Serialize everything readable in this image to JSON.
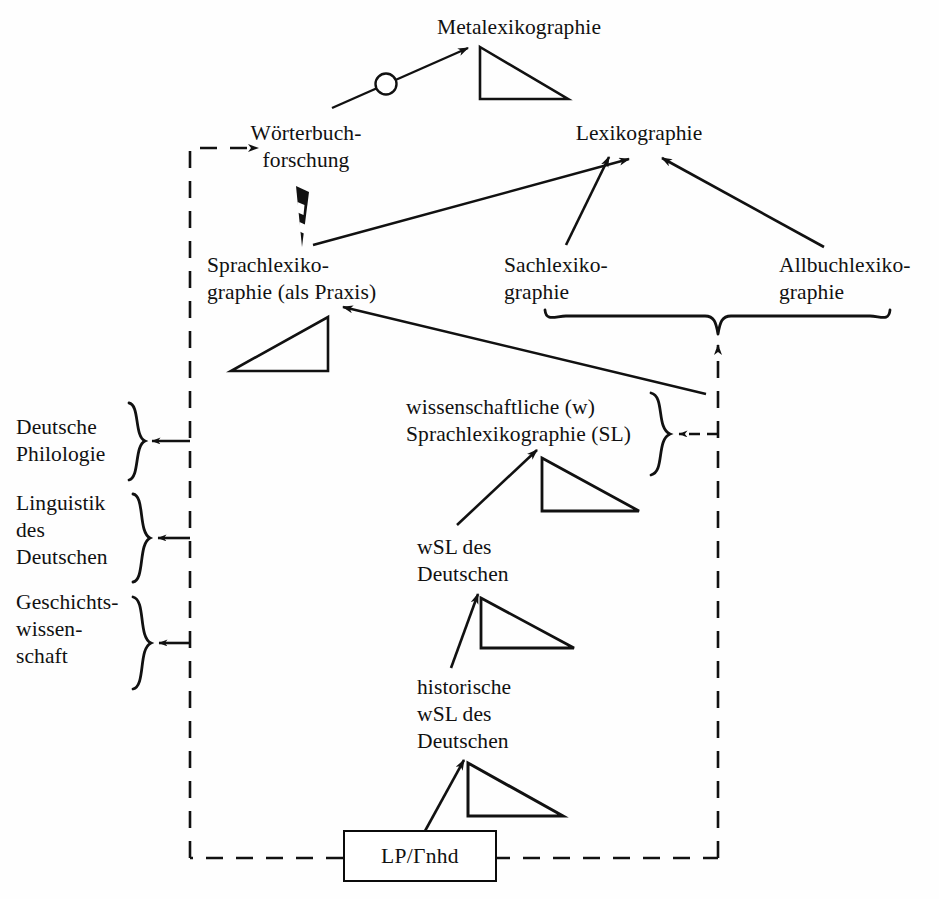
{
  "diagram": {
    "colors": {
      "ink": "#111111",
      "background": "#ffffff",
      "dashed": "#111111"
    },
    "nodes": [
      {
        "id": "metalexikographie",
        "label": "Metalexikographie",
        "x": 519,
        "y": 16,
        "align": "center"
      },
      {
        "id": "woerterbuchforschung",
        "label": "Wörterbuch-\nforschung",
        "x": 306,
        "y": 122,
        "align": "center"
      },
      {
        "id": "lexikographie",
        "label": "Lexikographie",
        "x": 639,
        "y": 122,
        "align": "center"
      },
      {
        "id": "sprachlexikographie",
        "label": "Sprachlexiko-\ngraphie (als Praxis)",
        "x": 207,
        "y": 254,
        "align": "left"
      },
      {
        "id": "sachlexikographie",
        "label": "Sachlexiko-\ngraphie",
        "x": 504,
        "y": 254,
        "align": "left"
      },
      {
        "id": "allbuchlexikographie",
        "label": "Allbuchlexiko-\ngraphie",
        "x": 779,
        "y": 254,
        "align": "left"
      },
      {
        "id": "deutsche-philologie",
        "label": "Deutsche\nPhilologie",
        "x": 16,
        "y": 417,
        "align": "left"
      },
      {
        "id": "linguistik-des-deutschen",
        "label": "Linguistik\ndes\nDeutschen",
        "x": 16,
        "y": 493,
        "align": "left"
      },
      {
        "id": "geschichtswissenschaft",
        "label": "Geschichts-\nwissen-\nschaft",
        "x": 16,
        "y": 592,
        "align": "left"
      },
      {
        "id": "wissenschaftliche-sl",
        "label": "wissenschaftliche (w)\nSprachlexikographie (SL)",
        "x": 406,
        "y": 397,
        "align": "left"
      },
      {
        "id": "wsl-des-deutschen",
        "label": "wSL des\nDeutschen",
        "x": 417,
        "y": 537,
        "align": "left"
      },
      {
        "id": "historische-wsl-des-deutschen",
        "label": "historische\nwSL des\nDeutschen",
        "x": 417,
        "y": 677,
        "align": "left"
      }
    ],
    "box": {
      "id": "lp-fnhd",
      "label": "LP/Гnhd",
      "x": 343,
      "y": 830,
      "width": 150,
      "height": 48
    },
    "braces": [
      {
        "id": "brace-deutsche-philologie",
        "orientation": "right",
        "x": 129,
        "y": 403,
        "height": 78
      },
      {
        "id": "brace-linguistik",
        "orientation": "right",
        "x": 133,
        "y": 494,
        "height": 88
      },
      {
        "id": "brace-geschichtswissenschaft",
        "orientation": "right",
        "x": 133,
        "y": 597,
        "height": 92
      },
      {
        "id": "brace-wissenschaftliche-sl",
        "orientation": "right",
        "x": 651,
        "y": 393,
        "height": 82
      },
      {
        "id": "brace-sach-allbuch",
        "orientation": "down",
        "x1": 545,
        "x2": 890,
        "y": 310,
        "tipX": 718,
        "tipY": 334
      }
    ],
    "triangles": [
      {
        "id": "triangle-metalexikographie",
        "x": 480,
        "y": 47,
        "width": 88,
        "height": 52,
        "facing": "right"
      },
      {
        "id": "triangle-sprachlexikographie",
        "x": 231,
        "y": 317,
        "width": 97,
        "height": 54,
        "facing": "right"
      },
      {
        "id": "triangle-wissenschaftliche-sl",
        "x": 542,
        "y": 458,
        "width": 97,
        "height": 53,
        "facing": "left"
      },
      {
        "id": "triangle-wsl-des-deutschen",
        "x": 481,
        "y": 598,
        "width": 93,
        "height": 50,
        "facing": "left"
      },
      {
        "id": "triangle-historische-wsl",
        "x": 468,
        "y": 763,
        "width": 95,
        "height": 53,
        "facing": "left"
      }
    ],
    "arrows": [
      {
        "id": "arrow-wb-to-metalex",
        "from": "woerterbuchforschung",
        "to": "metalexikographie",
        "style": "solid",
        "marker": "circle"
      },
      {
        "id": "arrow-wb-to-sprachlex",
        "from": "woerterbuchforschung",
        "to": "sprachlexikographie",
        "style": "thick-wedge"
      },
      {
        "id": "arrow-sprachlex-to-lexikographie",
        "from": "sprachlexikographie",
        "to": "lexikographie",
        "style": "solid"
      },
      {
        "id": "arrow-sachlex-to-lexikographie",
        "from": "sachlexikographie",
        "to": "lexikographie",
        "style": "solid"
      },
      {
        "id": "arrow-allbuchlex-to-lexikographie",
        "from": "allbuchlexikographie",
        "to": "lexikographie",
        "style": "solid"
      },
      {
        "id": "arrow-wsl-to-sprachlex",
        "from": "wissenschaftliche-sl",
        "to": "sprachlexikographie",
        "style": "solid"
      },
      {
        "id": "arrow-wsldeutsch-to-wsl",
        "from": "wsl-des-deutschen",
        "to": "wissenschaftliche-sl",
        "style": "solid"
      },
      {
        "id": "arrow-hist-to-wsldeutsch",
        "from": "historische-wsl-des-deutschen",
        "to": "wsl-des-deutschen",
        "style": "solid"
      },
      {
        "id": "arrow-box-to-hist",
        "from": "lp-fnhd",
        "to": "historische-wsl-des-deutschen",
        "style": "solid"
      },
      {
        "id": "arrow-dashed-to-woerterbuchforschung",
        "from": "lp-fnhd",
        "to": "woerterbuchforschung",
        "style": "dashed"
      },
      {
        "id": "arrow-dashed-to-deutsche-philologie",
        "from": "lp-fnhd",
        "to": "deutsche-philologie",
        "style": "dashed"
      },
      {
        "id": "arrow-dashed-to-linguistik",
        "from": "lp-fnhd",
        "to": "linguistik-des-deutschen",
        "style": "dashed"
      },
      {
        "id": "arrow-dashed-to-geschichtswissenschaft",
        "from": "lp-fnhd",
        "to": "geschichtswissenschaft",
        "style": "dashed"
      },
      {
        "id": "arrow-dashed-to-wissenschaftliche-sl",
        "from": "lp-fnhd",
        "to": "wissenschaftliche-sl",
        "style": "dashed"
      },
      {
        "id": "arrow-dashed-to-sach-allbuch-brace",
        "from": "lp-fnhd",
        "to": "brace-sach-allbuch",
        "style": "dashed"
      }
    ]
  }
}
